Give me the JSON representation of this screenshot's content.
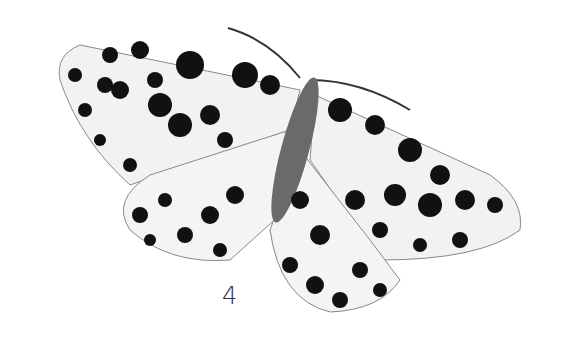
{
  "figure": {
    "label": "4",
    "colors": {
      "background": "#ffffff",
      "wing": "#f2f2f2",
      "spot": "#111111",
      "body": "#555555"
    }
  }
}
